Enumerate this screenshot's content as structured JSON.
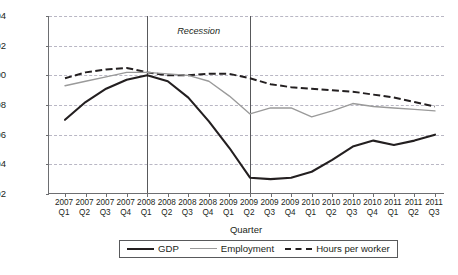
{
  "chart_data": {
    "type": "line",
    "title": "",
    "xlabel": "Quarter",
    "ylabel": "2008Q1=100",
    "ylim": [
      92,
      104
    ],
    "yticks": [
      92,
      94,
      96,
      98,
      100,
      102,
      104
    ],
    "grid": true,
    "legend_position": "bottom",
    "categories": [
      "2007 Q1",
      "2007 Q2",
      "2007 Q3",
      "2007 Q4",
      "2008 Q1",
      "2008 Q2",
      "2008 Q3",
      "2008 Q4",
      "2009 Q1",
      "2009 Q2",
      "2009 Q3",
      "2009 Q4",
      "2010 Q1",
      "2010 Q2",
      "2010 Q3",
      "2010 Q4",
      "2011 Q1",
      "2011 Q2",
      "2011 Q3"
    ],
    "series": [
      {
        "name": "GDP",
        "color": "#231f20",
        "style": "solid-thick",
        "values": [
          97.0,
          98.2,
          99.1,
          99.7,
          100.0,
          99.6,
          98.5,
          96.9,
          95.1,
          93.1,
          93.0,
          93.1,
          93.5,
          94.3,
          95.2,
          95.6,
          95.3,
          95.6,
          96.0
        ]
      },
      {
        "name": "Employment",
        "color": "#9a9a9a",
        "style": "solid-thin",
        "values": [
          99.3,
          99.6,
          99.9,
          100.2,
          100.2,
          100.1,
          100.0,
          99.6,
          98.6,
          97.4,
          97.8,
          97.8,
          97.2,
          97.6,
          98.1,
          97.9,
          97.8,
          97.7,
          97.6
        ]
      },
      {
        "name": "Hours per worker",
        "color": "#231f20",
        "style": "dashed",
        "values": [
          99.8,
          100.2,
          100.4,
          100.5,
          100.2,
          100.0,
          100.0,
          100.1,
          100.1,
          99.8,
          99.4,
          99.2,
          99.1,
          99.0,
          98.9,
          98.7,
          98.5,
          98.2,
          97.9
        ]
      }
    ],
    "annotations": [
      {
        "name": "recession-label",
        "text": "Recession",
        "start_category": "2008 Q1",
        "end_category": "2009 Q2"
      }
    ]
  },
  "axis": {
    "y_title": "2008Q1=100",
    "x_title": "Quarter"
  },
  "legend": {
    "items": [
      {
        "label": "GDP"
      },
      {
        "label": "Employment"
      },
      {
        "label": "Hours per worker"
      }
    ]
  },
  "caption": {
    "text": ""
  }
}
